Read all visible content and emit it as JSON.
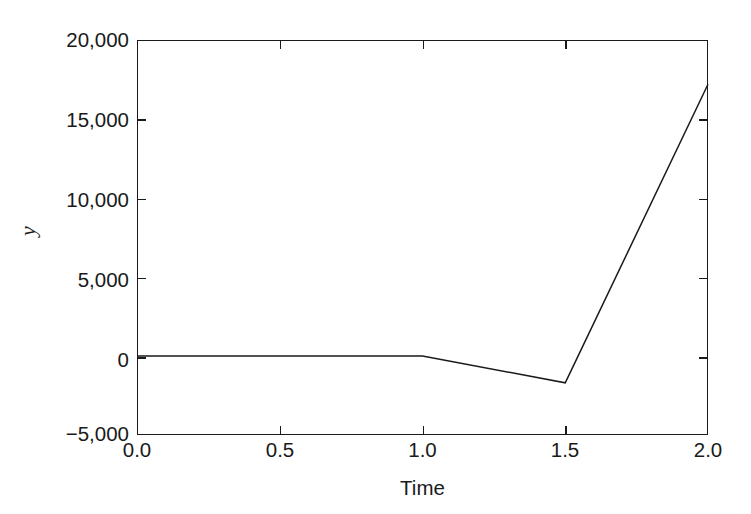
{
  "chart_data": {
    "type": "line",
    "title": "",
    "xlabel": "Time",
    "ylabel": "y",
    "xlim": [
      0.0,
      2.0
    ],
    "ylim": [
      -5000,
      20000
    ],
    "grid": false,
    "legend": null,
    "xticks": [
      {
        "value": 0.0,
        "label": "0.0"
      },
      {
        "value": 0.5,
        "label": "0.5"
      },
      {
        "value": 1.0,
        "label": "1.0"
      },
      {
        "value": 1.5,
        "label": "1.5"
      },
      {
        "value": 2.0,
        "label": "2.0"
      }
    ],
    "yticks": [
      {
        "value": 20000,
        "label": "20,000"
      },
      {
        "value": 15000,
        "label": "15,000"
      },
      {
        "value": 10000,
        "label": "10,000"
      },
      {
        "value": 5000,
        "label": "5,000"
      },
      {
        "value": 0,
        "label": "0"
      },
      {
        "value": -5000,
        "label": "−5,000"
      }
    ],
    "series": [
      {
        "name": "y",
        "color": "#1a1a1a",
        "x": [
          0.0,
          0.5,
          1.0,
          1.5,
          2.0
        ],
        "values": [
          0,
          0,
          0,
          -1700,
          17200
        ]
      }
    ]
  },
  "axis_titles": {
    "x": "Time",
    "y": "y"
  }
}
